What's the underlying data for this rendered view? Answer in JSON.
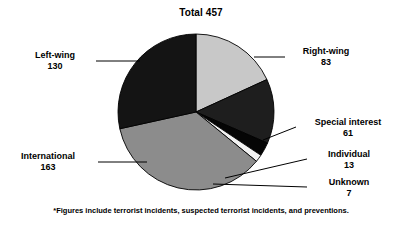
{
  "chart_data": {
    "type": "pie",
    "title": "Total 457",
    "total": 457,
    "categories": [
      "Right-wing",
      "Special interest",
      "Individual",
      "Unknown",
      "International",
      "Left-wing"
    ],
    "values": [
      83,
      61,
      13,
      7,
      163,
      130
    ],
    "slices": [
      {
        "label": "Right-wing",
        "value": 83,
        "value_text": "83",
        "color": "#c8c8c8",
        "start_angle": 0.0,
        "end_angle": 65.4
      },
      {
        "label": "Special interest",
        "value": 61,
        "value_text": "61",
        "color": "#1e1e1e",
        "start_angle": 65.4,
        "end_angle": 113.5
      },
      {
        "label": "Individual",
        "value": 13,
        "value_text": "13",
        "color": "#050505",
        "start_angle": 113.5,
        "end_angle": 123.7
      },
      {
        "label": "Unknown",
        "value": 7,
        "value_text": "7",
        "color": "#f2f2f2",
        "start_angle": 123.7,
        "end_angle": 129.2
      },
      {
        "label": "International",
        "value": 163,
        "value_text": "163",
        "color": "#8c8c8c",
        "start_angle": 129.2,
        "end_angle": 257.6
      },
      {
        "label": "Left-wing",
        "value": 130,
        "value_text": "130",
        "color": "#141414",
        "start_angle": 257.6,
        "end_angle": 360.0
      }
    ],
    "legend": "none",
    "footnote": "*Figures include terrorist incidents, suspected terrorist incidents, and preventions."
  },
  "labels": {
    "left_wing": {
      "category": "Left-wing",
      "value": "130"
    },
    "international": {
      "category": "International",
      "value": "163"
    },
    "right_wing": {
      "category": "Right-wing",
      "value": "83"
    },
    "special_interest": {
      "category": "Special interest",
      "value": "61"
    },
    "individual": {
      "category": "Individual",
      "value": "13"
    },
    "unknown": {
      "category": "Unknown",
      "value": "7"
    }
  },
  "colors": {
    "background": "#ffffff",
    "text": "#000000",
    "outline": "#000000",
    "right_wing": "#c8c8c8",
    "special_interest": "#1e1e1e",
    "individual": "#050505",
    "unknown": "#f2f2f2",
    "international": "#8c8c8c",
    "left_wing": "#141414"
  }
}
